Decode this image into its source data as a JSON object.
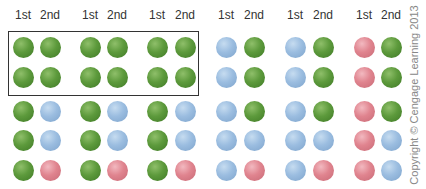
{
  "columns": [
    {
      "label": "1st",
      "x": 23
    },
    {
      "label": "2nd",
      "x": 50
    },
    {
      "label": "1st",
      "x": 90
    },
    {
      "label": "2nd",
      "x": 117
    },
    {
      "label": "1st",
      "x": 157
    },
    {
      "label": "2nd",
      "x": 185
    },
    {
      "label": "1st",
      "x": 226
    },
    {
      "label": "2nd",
      "x": 254
    },
    {
      "label": "1st",
      "x": 295
    },
    {
      "label": "2nd",
      "x": 323
    },
    {
      "label": "1st",
      "x": 364
    },
    {
      "label": "2nd",
      "x": 391
    }
  ],
  "row_y": [
    47,
    77,
    111,
    140,
    170
  ],
  "colors": {
    "green": "#5d9a3c",
    "blue": "#9bbde0",
    "red": "#e0848f"
  },
  "grid": [
    [
      "green",
      "green",
      "green",
      "green",
      "green",
      "green",
      "blue",
      "green",
      "blue",
      "green",
      "red",
      "green"
    ],
    [
      "green",
      "green",
      "green",
      "green",
      "green",
      "green",
      "blue",
      "green",
      "blue",
      "green",
      "red",
      "green"
    ],
    [
      "green",
      "blue",
      "green",
      "blue",
      "green",
      "blue",
      "blue",
      "green",
      "blue",
      "green",
      "red",
      "green"
    ],
    [
      "green",
      "blue",
      "green",
      "blue",
      "green",
      "blue",
      "blue",
      "blue",
      "blue",
      "blue",
      "red",
      "blue"
    ],
    [
      "green",
      "red",
      "green",
      "red",
      "green",
      "red",
      "blue",
      "red",
      "blue",
      "red",
      "red",
      "blue"
    ]
  ],
  "highlight_box": {
    "label": "boxed region: first two rows, first three pairs"
  },
  "copyright": "Copyright © Cengage Learning 2013"
}
